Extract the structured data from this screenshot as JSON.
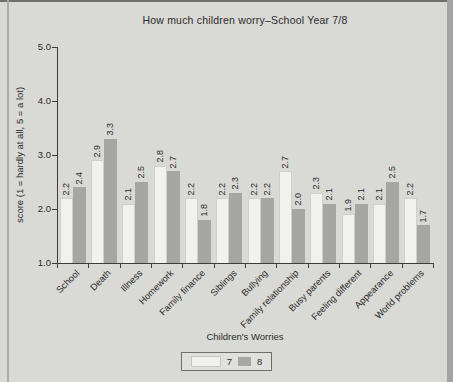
{
  "colors": {
    "page_background": "#d9d9d6",
    "bar_year7": "#f1f1ee",
    "bar_year8": "#a6a6a3",
    "axis": "#3c3c3a",
    "text": "#2b2b29"
  },
  "chart_data": {
    "type": "bar",
    "title": "How much children worry–School Year 7/8",
    "xlabel": "Children's Worries",
    "ylabel": "score (1 = hardly at all, 5 = a lot)",
    "ylim": [
      1.0,
      5.0
    ],
    "ytick_labels": [
      "5.0",
      "4.0",
      "3.0",
      "2.0",
      "1.0"
    ],
    "ytick_values": [
      5.0,
      4.0,
      3.0,
      2.0,
      1.0
    ],
    "grid": "off",
    "value_labels_shown": true,
    "legend_position": "bottom",
    "categories": [
      "School",
      "Death",
      "Illness",
      "Homework",
      "Family finance",
      "Siblings",
      "Bullying",
      "Family relationship",
      "Busy parents",
      "Feeling different",
      "Appearance",
      "World problems"
    ],
    "series": [
      {
        "name": "7",
        "values": [
          2.2,
          2.9,
          2.1,
          2.8,
          2.2,
          2.2,
          2.2,
          2.7,
          2.3,
          1.9,
          2.1,
          2.2
        ]
      },
      {
        "name": "8",
        "values": [
          2.4,
          3.3,
          2.5,
          2.7,
          1.8,
          2.3,
          2.2,
          2.0,
          2.1,
          2.1,
          2.5,
          1.7
        ]
      }
    ]
  }
}
